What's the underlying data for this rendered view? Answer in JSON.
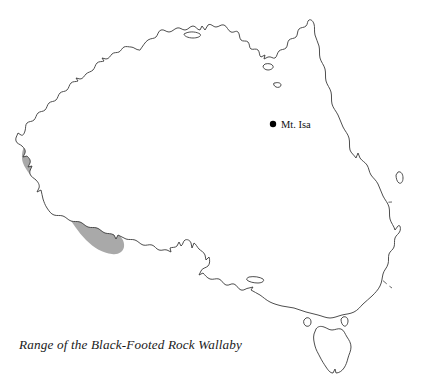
{
  "figure": {
    "caption": "Range of the Black-Footed Rock Wallaby",
    "width": 428,
    "height": 385
  },
  "colors": {
    "background": "#ffffff",
    "coastline": "#3a3a3a",
    "state_border": "#555555",
    "range_fill": "#a9a9a9",
    "city_dot": "#000000",
    "caption_text": "#1a1a1a"
  },
  "cities": [
    {
      "name": "Mt. Isa",
      "label": "Mt. Isa",
      "dot_x": 273,
      "dot_y": 124,
      "label_x": 281,
      "label_y": 128
    }
  ],
  "range_areas": [
    {
      "name": "western-range-band",
      "description": "Long diagonal band across southwestern Western Australia"
    },
    {
      "name": "central-range-ellipse",
      "description": "Tilted ellipse across central Australia near the Northern Territory / Western Australia border"
    },
    {
      "name": "mount-isa-range-patch",
      "description": "Small circular patch surrounding Mt. Isa in western Queensland"
    }
  ],
  "state_borders": [
    {
      "name": "wa-nt-border",
      "orientation": "vertical"
    },
    {
      "name": "nt-qld-border",
      "orientation": "vertical"
    },
    {
      "name": "wa-sa-border",
      "orientation": "vertical"
    },
    {
      "name": "nt-sa-border",
      "orientation": "horizontal"
    },
    {
      "name": "sa-qld-border",
      "orientation": "horizontal"
    },
    {
      "name": "sa-nsw-border",
      "orientation": "horizontal"
    },
    {
      "name": "qld-nsw-border",
      "orientation": "horizontal"
    },
    {
      "name": "nsw-vic-border",
      "orientation": "horizontal"
    }
  ],
  "islands": [
    {
      "name": "tasmania"
    },
    {
      "name": "kangaroo-island"
    },
    {
      "name": "king-island"
    },
    {
      "name": "flinders-island"
    },
    {
      "name": "groote-eylandt"
    },
    {
      "name": "mornington-island"
    },
    {
      "name": "fraser-island"
    },
    {
      "name": "melville-island"
    }
  ]
}
